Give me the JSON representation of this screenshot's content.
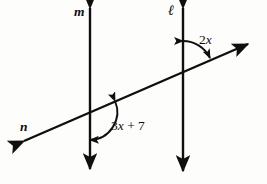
{
  "figure": {
    "type": "geometry-diagram",
    "background_color": "#fdfdfc",
    "stroke_color": "#100f0d"
  },
  "labels": {
    "line_m": "m",
    "line_l": "ℓ",
    "line_n": "n",
    "angle_upper": "2",
    "angle_upper_var": "x",
    "angle_lower_coeff": "3",
    "angle_lower_var": "x",
    "angle_lower_rest": " + 7"
  },
  "geometry": {
    "line_m": {
      "x": 90,
      "y_top": 3,
      "y_bottom": 174
    },
    "line_l": {
      "x": 183,
      "y_top": 3,
      "y_bottom": 176
    },
    "transversal_n": {
      "x1": 19,
      "y1": 143,
      "x2": 253,
      "y2": 41
    },
    "intersection_m": {
      "x": 90,
      "y": 112
    },
    "intersection_l": {
      "x": 183,
      "y": 71
    },
    "angle_upper_arc": {
      "center_x": 183,
      "center_y": 71,
      "radius": 30
    },
    "angle_lower_arc": {
      "center_x": 90,
      "center_y": 112,
      "radius": 28
    }
  }
}
